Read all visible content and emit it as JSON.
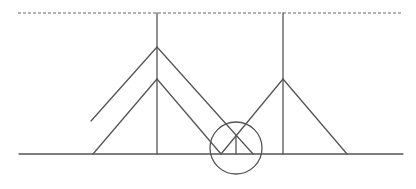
{
  "diagram": {
    "colors": {
      "line": "#555555",
      "dashed": "#666666",
      "background": "#ffffff"
    },
    "ceiling_dashed_line": {
      "x1": 18,
      "y1": 13,
      "x2": 402,
      "y2": 13
    },
    "ground_line": {
      "x1": 19,
      "y1": 154,
      "x2": 403,
      "y2": 154
    },
    "poles": [
      {
        "name": "left-pole",
        "x": 157,
        "y_top": 13,
        "y_bottom": 154
      },
      {
        "name": "right-pole",
        "x": 283,
        "y_top": 13,
        "y_bottom": 154
      }
    ],
    "segments": [
      {
        "name": "outer-left-arm",
        "x1": 157,
        "y1": 47,
        "x2": 91,
        "y2": 121
      },
      {
        "name": "outer-right-arm",
        "x1": 157,
        "y1": 47,
        "x2": 253,
        "y2": 154
      },
      {
        "name": "inner-left-arm",
        "x1": 157,
        "y1": 79,
        "x2": 93,
        "y2": 154
      },
      {
        "name": "inner-right-arm",
        "x1": 157,
        "y1": 79,
        "x2": 221,
        "y2": 154
      },
      {
        "name": "right-pole-left-arm",
        "x1": 283,
        "y1": 79,
        "x2": 221,
        "y2": 154
      },
      {
        "name": "right-pole-right-arm",
        "x1": 283,
        "y1": 79,
        "x2": 347,
        "y2": 154
      },
      {
        "name": "intersection-drop-line",
        "x1": 236,
        "y1": 135,
        "x2": 236,
        "y2": 154
      }
    ],
    "highlight_circle": {
      "cx": 236,
      "cy": 148,
      "r": 26
    }
  }
}
